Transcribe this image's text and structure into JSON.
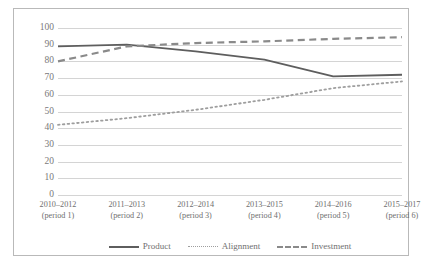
{
  "chart_data": {
    "type": "line",
    "title": "",
    "xlabel": "",
    "ylabel": "",
    "ylim": [
      0,
      100
    ],
    "ytick_step": 10,
    "grid": true,
    "legend_position": "bottom",
    "yticks": [
      "100",
      "90",
      "80",
      "70",
      "60",
      "50",
      "40",
      "30",
      "20",
      "10",
      "0"
    ],
    "categories": [
      "2010–2012",
      "2011–2013",
      "2012–2014",
      "2013–2015",
      "2014–2016",
      "2015–2017"
    ],
    "category_sublabels": [
      "(period 1)",
      "(period 2)",
      "(period 3)",
      "(period 4)",
      "(period 5)",
      "(period 6)"
    ],
    "series": [
      {
        "name": "Product",
        "style": "solid",
        "color": "#5e5e5e",
        "values": [
          89,
          90,
          86,
          81,
          71,
          72
        ]
      },
      {
        "name": "Alignment",
        "style": "dotted",
        "color": "#9e9e9e",
        "values": [
          42,
          46,
          51,
          57,
          64,
          68
        ]
      },
      {
        "name": "Investment",
        "style": "dashed",
        "color": "#8a8a8a",
        "values": [
          80,
          89,
          91,
          92,
          93.5,
          94.5
        ]
      }
    ]
  },
  "legend": {
    "items": [
      {
        "label": "Product"
      },
      {
        "label": "Alignment"
      },
      {
        "label": "Investment"
      }
    ]
  }
}
